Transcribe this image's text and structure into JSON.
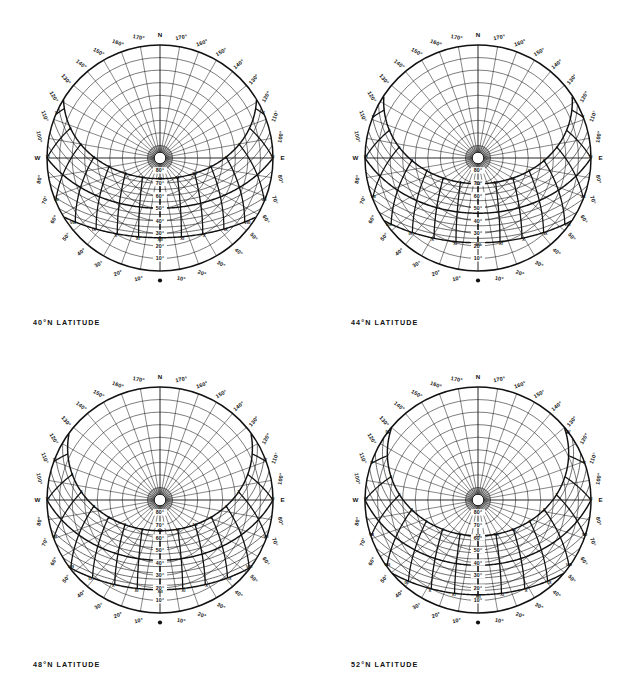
{
  "page": {
    "background_color": "#ffffff",
    "line_color": "#111111",
    "width": 641,
    "height": 695,
    "layout": "2x2 grid of sun path (solar altitude-azimuth) diagrams"
  },
  "charts": [
    {
      "id": "chart-40n",
      "caption": "40°N LATITUDE",
      "latitude": 40,
      "position": {
        "left": 0,
        "top": 6
      }
    },
    {
      "id": "chart-44n",
      "caption": "44°N LATITUDE",
      "latitude": 44,
      "position": {
        "left": 318,
        "top": 6
      }
    },
    {
      "id": "chart-48n",
      "caption": "48°N LATITUDE",
      "latitude": 48,
      "position": {
        "left": 0,
        "top": 348
      }
    },
    {
      "id": "chart-52n",
      "caption": "52°N LATITUDE",
      "latitude": 52,
      "position": {
        "left": 318,
        "top": 348
      }
    }
  ],
  "chart_data": {
    "type": "scatter",
    "title": "",
    "subtitle": "",
    "projection": "equidistant polar (sun path chart), South at bottom, North at top",
    "xlabel": "Azimuth (degrees from South)",
    "ylabel": "Altitude (degrees above horizon)",
    "grid": true,
    "legend_position": "none",
    "azimuth_ticks": [
      "N",
      "170°",
      "160°",
      "150°",
      "140°",
      "130°",
      "120°",
      "110°",
      "100°",
      "W",
      "80°",
      "70°",
      "60°",
      "50°",
      "40°",
      "30°",
      "20°",
      "10°",
      "S",
      "10°",
      "20°",
      "30°",
      "40°",
      "50°",
      "60°",
      "70°",
      "80°",
      "E",
      "100°",
      "110°",
      "120°",
      "130°",
      "140°",
      "150°",
      "160°",
      "170°"
    ],
    "azimuth_step_deg": 10,
    "cardinals": {
      "north": "N",
      "south": "S",
      "east": "E",
      "west": "W"
    },
    "altitude_ticks": [
      "10°",
      "20°",
      "30°",
      "40°",
      "50°",
      "60°",
      "70°",
      "80°"
    ],
    "altitude_step_deg": 10,
    "altitude_range": [
      0,
      90
    ],
    "hour_labels_morning": [
      "IV",
      "V",
      "VI",
      "VII",
      "VIII",
      "IX",
      "X",
      "XI",
      "XII"
    ],
    "hour_labels_afternoon": [
      "XII",
      "XI",
      "X",
      "IX",
      "VIII",
      "VII",
      "VI",
      "V",
      "IV"
    ],
    "hour_numerals_arabic": [
      "1",
      "2",
      "3",
      "4",
      "5",
      "6",
      "7",
      "8",
      "9",
      "10",
      "11",
      "12"
    ],
    "declination_curves_deg": [
      23.5,
      20,
      15,
      10,
      5,
      0,
      -5,
      -10,
      -15,
      -20,
      -23.5
    ],
    "series": [
      {
        "name": "Summer solstice sun path (declination +23.5°)",
        "declination": 23.5,
        "style": "heavy"
      },
      {
        "name": "Equinox sun path (declination 0°)",
        "declination": 0,
        "style": "heavy"
      },
      {
        "name": "Winter solstice sun path (declination -23.5°)",
        "declination": -23.5,
        "style": "heavy"
      }
    ],
    "hour_line_hours": [
      4,
      5,
      6,
      7,
      8,
      9,
      10,
      11,
      12,
      13,
      14,
      15,
      16,
      17,
      18,
      19,
      20
    ]
  }
}
